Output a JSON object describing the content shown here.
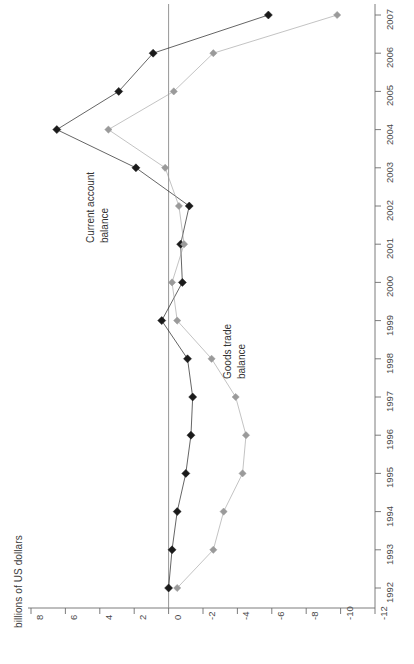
{
  "chart_data": {
    "type": "line",
    "title": "",
    "subtitle": "",
    "xlabel": "",
    "ylabel": "billions of US dollars",
    "orientation": "horizontal-value-axis",
    "grid": false,
    "legend_position": "inline-annotations",
    "ylim": [
      -12,
      8
    ],
    "value_ticks": [
      "8",
      "6",
      "4",
      "2",
      "0",
      "-2",
      "-4",
      "-6",
      "-8",
      "-10",
      "-12"
    ],
    "value_tick_numbers": [
      8,
      6,
      4,
      2,
      0,
      -2,
      -4,
      -6,
      -8,
      -10,
      -12
    ],
    "categories": [
      "1992",
      "1993",
      "1994",
      "1995",
      "1996",
      "1997",
      "1998",
      "1999",
      "2000",
      "2001",
      "2002",
      "2003",
      "2004",
      "2005",
      "2006",
      "2007"
    ],
    "series": [
      {
        "name": "Current account balance",
        "color": "#1a1a1a",
        "marker": "diamond",
        "values": [
          0.0,
          -0.2,
          -0.5,
          -1.0,
          -1.3,
          -1.4,
          -1.1,
          0.4,
          -0.8,
          -0.7,
          -1.2,
          1.9,
          6.5,
          2.9,
          0.9,
          -5.8
        ]
      },
      {
        "name": "Goods trade balance",
        "color": "#9a9a9a",
        "marker": "diamond",
        "values": [
          -0.5,
          -2.6,
          -3.2,
          -4.3,
          -4.5,
          -3.9,
          -2.5,
          -0.5,
          -0.2,
          -0.9,
          -0.6,
          0.2,
          3.5,
          -0.3,
          -2.6,
          -9.8
        ]
      }
    ],
    "annotations": [
      {
        "name": "current-account-balance",
        "text_line1": "Current account",
        "text_line2": "balance"
      },
      {
        "name": "goods-trade-balance",
        "text_line1": "Goods trade",
        "text_line2": "balance"
      }
    ]
  },
  "axis": {
    "value_axis_title": "billions of US dollars",
    "zero_line_value": 0
  },
  "colors": {
    "current_account": "#1a1a1a",
    "goods_trade": "#9a9a9a",
    "axis": "#6e6e6e",
    "zero_line": "#8a8a8a",
    "background": "#ffffff"
  }
}
